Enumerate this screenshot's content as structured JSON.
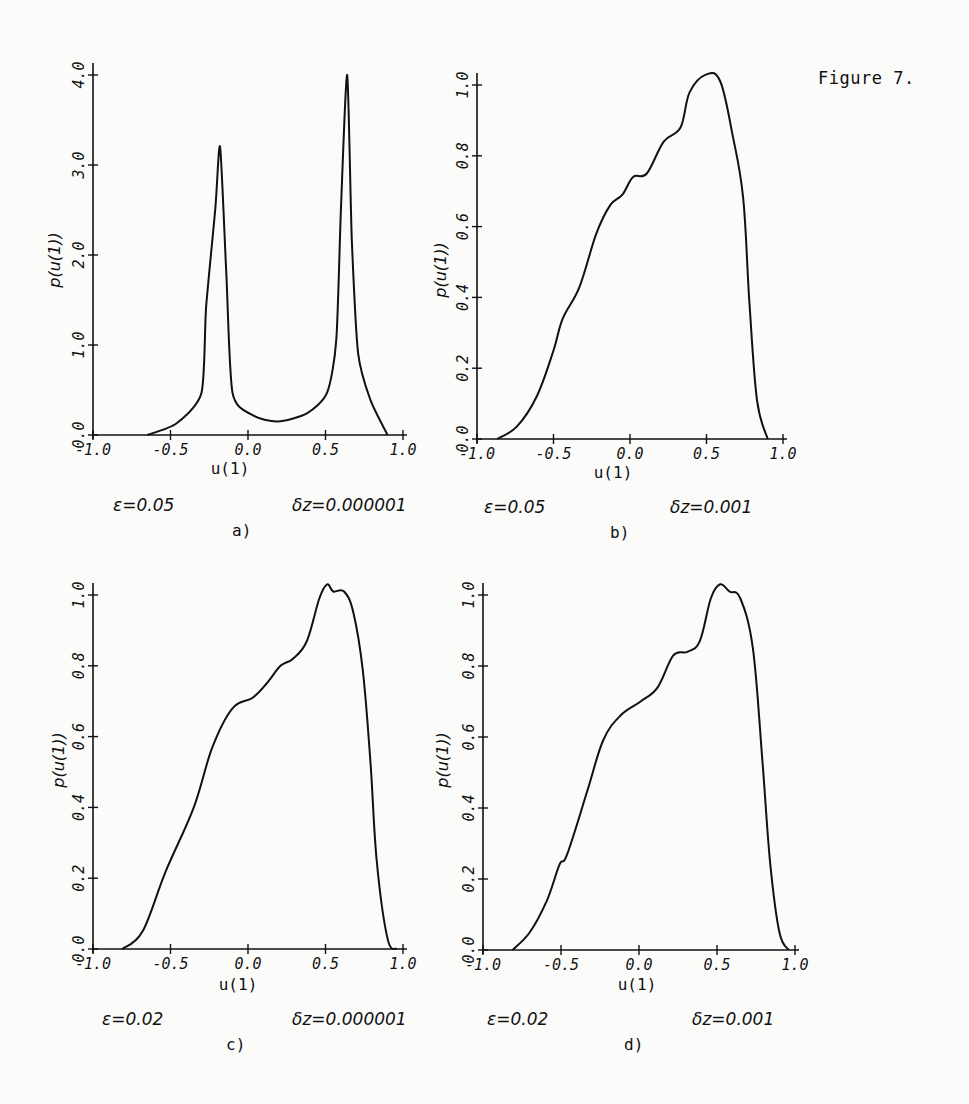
{
  "figure_title": "Figure 7.",
  "chart_data": [
    {
      "type": "line",
      "panel": "a)",
      "xlabel": "u(1)",
      "ylabel": "p(u(1))",
      "epsilon_label": "ε=0.05",
      "dz_label": "δz=0.000001",
      "xlim": [
        -1.0,
        1.0
      ],
      "ylim": [
        0.0,
        4.0
      ],
      "xticks": [
        "-1.0",
        "-0.5",
        "0.0",
        "0.5",
        "1.0"
      ],
      "yticks": [
        "0.0",
        "1.0",
        "2.0",
        "3.0",
        "4.0"
      ],
      "grid": false,
      "x": [
        -0.65,
        -0.46,
        -0.3,
        -0.27,
        -0.21,
        -0.18,
        -0.14,
        -0.1,
        0.03,
        0.19,
        0.38,
        0.51,
        0.57,
        0.6,
        0.64,
        0.67,
        0.71,
        0.79,
        0.9
      ],
      "y": [
        0.0,
        0.13,
        0.47,
        1.42,
        2.53,
        3.2,
        1.8,
        0.47,
        0.22,
        0.15,
        0.24,
        0.47,
        1.06,
        2.53,
        4.0,
        2.17,
        0.91,
        0.39,
        0.0
      ]
    },
    {
      "type": "line",
      "panel": "b)",
      "xlabel": "u(1)",
      "ylabel": "p(u(1))",
      "epsilon_label": "ε=0.05",
      "dz_label": "δz=0.001",
      "xlim": [
        -1.0,
        1.0
      ],
      "ylim": [
        0.0,
        1.0
      ],
      "xticks": [
        "-1.0",
        "-0.5",
        "0.0",
        "0.5",
        "1.0"
      ],
      "yticks": [
        "0.0",
        "0.2",
        "0.4",
        "0.6",
        "0.8",
        "1.0"
      ],
      "grid": false,
      "x": [
        -0.87,
        -0.74,
        -0.61,
        -0.5,
        -0.44,
        -0.33,
        -0.22,
        -0.13,
        -0.05,
        0.02,
        0.11,
        0.22,
        0.33,
        0.39,
        0.5,
        0.59,
        0.67,
        0.74,
        0.78,
        0.83,
        0.9
      ],
      "y": [
        0.0,
        0.035,
        0.12,
        0.25,
        0.34,
        0.43,
        0.58,
        0.66,
        0.69,
        0.74,
        0.75,
        0.84,
        0.88,
        0.98,
        1.03,
        1.01,
        0.86,
        0.68,
        0.39,
        0.11,
        0.0
      ]
    },
    {
      "type": "line",
      "panel": "c)",
      "xlabel": "u(1)",
      "ylabel": "p(u(1))",
      "epsilon_label": "ε=0.02",
      "dz_label": "δz=0.000001",
      "xlim": [
        -1.0,
        1.0
      ],
      "ylim": [
        0.0,
        1.0
      ],
      "xticks": [
        "-1.0",
        "-0.5",
        "0.0",
        "0.5",
        "1.0"
      ],
      "yticks": [
        "0.0",
        "0.2",
        "0.4",
        "0.6",
        "0.8",
        "1.0"
      ],
      "grid": false,
      "x": [
        -0.81,
        -0.68,
        -0.53,
        -0.35,
        -0.23,
        -0.1,
        0.03,
        0.12,
        0.21,
        0.29,
        0.38,
        0.46,
        0.51,
        0.55,
        0.62,
        0.68,
        0.74,
        0.79,
        0.83,
        0.9,
        0.96
      ],
      "y": [
        0.0,
        0.05,
        0.22,
        0.4,
        0.57,
        0.68,
        0.71,
        0.75,
        0.8,
        0.82,
        0.87,
        0.99,
        1.03,
        1.01,
        1.01,
        0.95,
        0.79,
        0.53,
        0.25,
        0.03,
        0.0
      ]
    },
    {
      "type": "line",
      "panel": "d)",
      "xlabel": "u(1)",
      "ylabel": "p(u(1))",
      "epsilon_label": "ε=0.02",
      "dz_label": "δz=0.001",
      "xlim": [
        -1.0,
        1.0
      ],
      "ylim": [
        0.0,
        1.0
      ],
      "xticks": [
        "-1.0",
        "-0.5",
        "0.0",
        "0.5",
        "1.0"
      ],
      "yticks": [
        "0.0",
        "0.2",
        "0.4",
        "0.6",
        "0.8",
        "1.0"
      ],
      "grid": false,
      "x": [
        -0.81,
        -0.7,
        -0.59,
        -0.51,
        -0.46,
        -0.33,
        -0.23,
        -0.12,
        0.01,
        0.12,
        0.22,
        0.31,
        0.39,
        0.46,
        0.52,
        0.58,
        0.65,
        0.73,
        0.79,
        0.84,
        0.9,
        0.96
      ],
      "y": [
        0.0,
        0.05,
        0.14,
        0.24,
        0.27,
        0.45,
        0.59,
        0.66,
        0.7,
        0.74,
        0.83,
        0.84,
        0.87,
        0.99,
        1.03,
        1.01,
        0.99,
        0.85,
        0.54,
        0.25,
        0.05,
        0.0
      ]
    }
  ]
}
